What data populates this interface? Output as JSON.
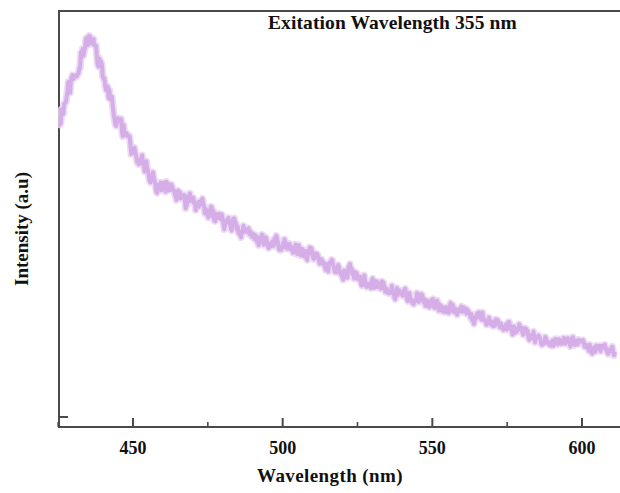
{
  "chart_data": {
    "type": "line",
    "title": "Exitation Wavelength 355 nm",
    "xlabel": "Wavelength (nm)",
    "ylabel": "Intensity (a.u)",
    "xlim": [
      425.6,
      611.0
    ],
    "ylim": [
      0,
      100
    ],
    "grid": false,
    "legend": null,
    "xticks": [
      450,
      500,
      550,
      600
    ],
    "xtick_labels": [
      "450",
      "500",
      "550",
      "600"
    ],
    "xminorticks": [
      425,
      475,
      525,
      575
    ],
    "yticks": [],
    "ytick_labels": [],
    "series": [
      {
        "name": "Photoluminescence emission",
        "color": "#d5aee8",
        "linewidth": 4,
        "noise_amplitude": 3.2,
        "x": [
          425.6,
          427.0,
          428.5,
          430.0,
          431.5,
          433.0,
          434.5,
          435.6,
          437.0,
          438.5,
          440.0,
          442.0,
          444.0,
          446.0,
          448.0,
          450.0,
          452.0,
          454.0,
          456.0,
          458.0,
          460.0,
          462.0,
          464.0,
          466.0,
          468.0,
          470.0,
          472.0,
          474.0,
          476.0,
          478.0,
          480.0,
          483.0,
          486.0,
          489.0,
          492.0,
          495.0,
          498.0,
          501.0,
          504.0,
          507.0,
          510.0,
          514.0,
          518.0,
          522.0,
          526.0,
          530.0,
          534.0,
          538.0,
          542.0,
          546.0,
          550.0,
          555.0,
          560.0,
          565.0,
          570.0,
          575.0,
          580.0,
          585.0,
          590.0,
          595.0,
          600.0,
          605.0,
          611.0
        ],
        "y": [
          79.0,
          83.0,
          86.5,
          89.5,
          92.5,
          95.5,
          97.8,
          99.0,
          97.5,
          94.5,
          90.5,
          86.0,
          82.0,
          78.5,
          75.5,
          72.5,
          70.0,
          67.8,
          66.0,
          64.5,
          63.6,
          63.0,
          62.2,
          61.2,
          60.2,
          59.4,
          58.8,
          58.0,
          57.0,
          56.0,
          55.0,
          53.6,
          52.4,
          51.4,
          50.6,
          50.0,
          49.4,
          48.8,
          48.0,
          47.2,
          46.2,
          45.0,
          43.8,
          42.6,
          41.4,
          40.0,
          38.8,
          37.6,
          36.6,
          35.6,
          34.6,
          33.4,
          32.2,
          31.0,
          29.8,
          28.6,
          27.6,
          26.6,
          25.8,
          25.0,
          24.2,
          23.4,
          22.6
        ],
        "peak": {
          "x": 435.6,
          "y": 99.0
        }
      }
    ]
  },
  "figure": {
    "background_color": "#ffffff",
    "frame_color": "#4a4a4a",
    "text_color": "#111111"
  }
}
